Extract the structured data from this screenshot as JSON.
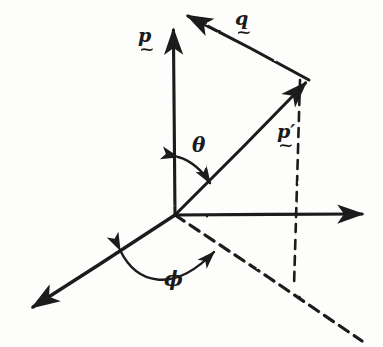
{
  "figure": {
    "background_color": "#fdfdfc",
    "ink_color": "#1a1a1a",
    "width": 383,
    "height": 347,
    "style": "hand-drawn pen sketch"
  },
  "labels": {
    "p": {
      "symbol": "p",
      "under_accent": "~"
    },
    "q": {
      "symbol": "q",
      "under_accent": "~"
    },
    "p_prime": {
      "symbol": "p′",
      "under_accent": "~"
    },
    "theta": {
      "symbol": "θ"
    },
    "phi": {
      "symbol": "ϕ"
    }
  },
  "geometry": {
    "origin": {
      "x": 175,
      "y": 215
    },
    "vector_p": {
      "from": [
        175,
        215
      ],
      "to": [
        173,
        10
      ],
      "arrow": "end",
      "style": "solid"
    },
    "vector_p_prime": {
      "from": [
        175,
        215
      ],
      "to": [
        308,
        78
      ],
      "arrow": "end",
      "style": "solid"
    },
    "vector_q": {
      "from": [
        308,
        80
      ],
      "to": [
        184,
        14
      ],
      "arrow": "end",
      "style": "solid"
    },
    "axis_right": {
      "from": [
        175,
        215
      ],
      "to": [
        370,
        214
      ],
      "arrow": "end",
      "style": "solid"
    },
    "axis_lower_left": {
      "from": [
        175,
        215
      ],
      "to": [
        26,
        312
      ],
      "arrow": "end",
      "style": "solid"
    },
    "axis_lower_right_dashed": {
      "from": [
        175,
        215
      ],
      "to": [
        362,
        341
      ],
      "arrow": "none",
      "style": "dashed"
    },
    "drop_line_dashed": {
      "from": [
        300,
        80
      ],
      "to": [
        294,
        286
      ],
      "arrow": "none",
      "style": "dashed"
    },
    "arc_theta": {
      "center": [
        175,
        215
      ],
      "radius": 58,
      "from_deg": 90,
      "to_deg": 46,
      "arrows": "both"
    },
    "arc_phi": {
      "center": [
        175,
        215
      ],
      "radius": 78,
      "from_deg": 213,
      "to_deg": 326,
      "arrows": "both"
    }
  }
}
